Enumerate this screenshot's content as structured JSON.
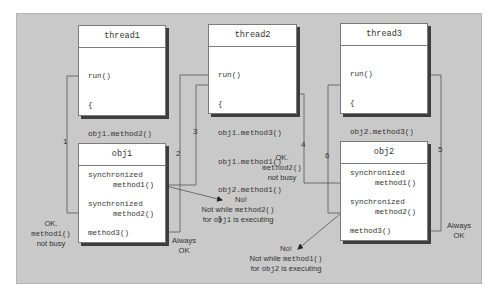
{
  "diagram": {
    "threads": [
      {
        "name": "thread1",
        "code": [
          "run()",
          "{",
          "obj1.method2()",
          "",
          "",
          "}"
        ]
      },
      {
        "name": "thread2",
        "code": [
          "run()",
          "{",
          "obj1.method3()",
          "obj1.method1()",
          "obj2.method1()",
          "}"
        ]
      },
      {
        "name": "thread3",
        "code": [
          "run()",
          "{",
          "obj2.method3()",
          "obj2.method2()",
          "",
          "}"
        ]
      }
    ],
    "objects": [
      {
        "name": "obj1",
        "sync1": "synchronized",
        "m1": "method1()",
        "sync2": "synchronized",
        "m2": "method2()",
        "m3": "method3()"
      },
      {
        "name": "obj2",
        "sync1": "synchronized",
        "m1": "method1()",
        "sync2": "synchronized",
        "m2": "method2()",
        "m3": "method3()"
      }
    ],
    "connectors": [
      "1",
      "2",
      "3",
      "4",
      "5",
      "6"
    ],
    "notes": {
      "ok1": {
        "l1": "OK.",
        "l2": "method1()",
        "l3": "not busy"
      },
      "ok2": {
        "l1": "OK.",
        "l2": "method2()",
        "l3": "not busy"
      },
      "always1": {
        "l1": "Always",
        "l2": "OK"
      },
      "always2": {
        "l1": "Always",
        "l2": "OK"
      },
      "no1": {
        "l1": "No!",
        "l2a": "Not while ",
        "l2b": "method2()",
        "l3a": "for ",
        "l3b": "obj1",
        "l3c": " is executing"
      },
      "no2": {
        "l1": "No!",
        "l2a": "Not while ",
        "l2b": "method1()",
        "l3a": "for ",
        "l3b": "obj2",
        "l3c": " is executing"
      }
    },
    "colors": {
      "panel": "#c9c9c9",
      "box": "#ffffff",
      "shadow": "#3e3e3e",
      "line": "#555555"
    }
  }
}
